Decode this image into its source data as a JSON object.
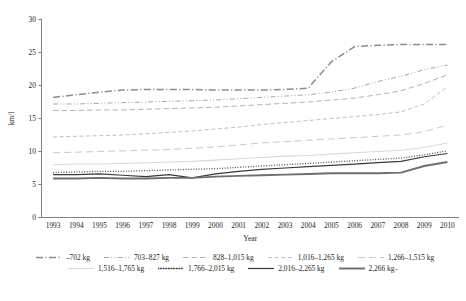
{
  "chart_data": {
    "type": "line",
    "title": "",
    "xlabel": "Year",
    "ylabel": "km/l",
    "x": [
      1993,
      1994,
      1995,
      1996,
      1997,
      1998,
      1999,
      2000,
      2001,
      2002,
      2003,
      2004,
      2005,
      2006,
      2007,
      2008,
      2009,
      2010
    ],
    "xtick_labels": [
      "1993",
      "1994",
      "1995",
      "1996",
      "1997",
      "1998",
      "1999",
      "2000",
      "2001",
      "2002",
      "2003",
      "2004",
      "2005",
      "2006",
      "2007",
      "2008",
      "2009",
      "2010"
    ],
    "ylim": [
      0,
      30
    ],
    "ytick_labels": [
      "0",
      "5",
      "10",
      "15",
      "20",
      "25",
      "30"
    ],
    "yticks": [
      0,
      5,
      10,
      15,
      20,
      25,
      30
    ],
    "grid": false,
    "legend_position": "bottom",
    "series": [
      {
        "name": "–702 kg",
        "dash": "dashdot",
        "color": "#8c8c8c",
        "width": 1.5,
        "values": [
          18.2,
          18.6,
          19.0,
          19.3,
          19.4,
          19.4,
          19.4,
          19.3,
          19.3,
          19.3,
          19.4,
          19.6,
          23.6,
          25.9,
          26.1,
          26.2,
          26.2,
          26.2
        ]
      },
      {
        "name": "703–827 kg",
        "dash": "dashdotdot",
        "color": "#a6a6a6",
        "width": 1.0,
        "values": [
          17.2,
          17.2,
          17.3,
          17.4,
          17.5,
          17.6,
          17.7,
          17.8,
          18.0,
          18.2,
          18.4,
          18.6,
          19.0,
          19.6,
          20.6,
          21.4,
          22.4,
          23.1
        ]
      },
      {
        "name": "828–1,015 kg",
        "dash": "longdash",
        "color": "#b3b3b3",
        "width": 1.0,
        "values": [
          16.2,
          16.2,
          16.3,
          16.3,
          16.4,
          16.5,
          16.6,
          16.7,
          16.9,
          17.1,
          17.3,
          17.5,
          17.8,
          18.1,
          18.6,
          19.2,
          20.3,
          21.6
        ]
      },
      {
        "name": "1,016–1,265 kg",
        "dash": "dashed",
        "color": "#bfbfbf",
        "width": 1.0,
        "values": [
          12.2,
          12.3,
          12.4,
          12.5,
          12.7,
          12.9,
          13.1,
          13.4,
          13.7,
          14.1,
          14.4,
          14.7,
          15.0,
          15.3,
          15.6,
          16.0,
          17.2,
          19.8
        ]
      },
      {
        "name": "1,266–1,515 kg",
        "dash": "widedash",
        "color": "#c9c9c9",
        "width": 1.0,
        "values": [
          9.8,
          9.9,
          10.0,
          10.1,
          10.2,
          10.3,
          10.5,
          10.7,
          11.0,
          11.3,
          11.5,
          11.7,
          11.9,
          12.1,
          12.3,
          12.5,
          13.0,
          14.0
        ]
      },
      {
        "name": "1,516–1,765 kg",
        "dash": "solid",
        "color": "#d9d9d9",
        "width": 1.1,
        "values": [
          8.0,
          8.1,
          8.1,
          8.2,
          8.3,
          8.4,
          8.5,
          8.7,
          8.9,
          9.1,
          9.3,
          9.4,
          9.6,
          9.8,
          10.0,
          10.2,
          10.6,
          11.3
        ]
      },
      {
        "name": "1,766–2,015 kg",
        "dash": "dotted",
        "color": "#3f3f3f",
        "width": 1.3,
        "values": [
          6.8,
          6.9,
          7.0,
          7.0,
          7.1,
          7.2,
          7.3,
          7.4,
          7.6,
          7.8,
          8.0,
          8.2,
          8.4,
          8.6,
          8.8,
          9.0,
          9.5,
          10.1
        ]
      },
      {
        "name": "2,016–2,265 kg",
        "dash": "solid",
        "color": "#3a3a3a",
        "width": 1.2,
        "values": [
          6.5,
          6.5,
          6.6,
          6.4,
          6.2,
          6.5,
          6.0,
          6.6,
          7.0,
          7.3,
          7.5,
          7.7,
          7.9,
          8.1,
          8.3,
          8.5,
          9.2,
          9.7
        ]
      },
      {
        "name": "2,266 kg–",
        "dash": "solid",
        "color": "#6e6e6e",
        "width": 1.9,
        "values": [
          5.9,
          5.9,
          6.0,
          5.9,
          5.9,
          6.0,
          6.0,
          6.2,
          6.3,
          6.4,
          6.5,
          6.6,
          6.7,
          6.7,
          6.7,
          6.8,
          7.8,
          8.4
        ]
      }
    ]
  },
  "legend": {
    "row1": [
      "–702 kg",
      "703–827 kg",
      "828–1,015 kg",
      "1,016–1,265 kg",
      "1,266–1,515 kg"
    ],
    "row2": [
      "1,516–1,765 kg",
      "1,766–2,015 kg",
      "2,016–2,265 kg",
      "2,266 kg–"
    ]
  }
}
